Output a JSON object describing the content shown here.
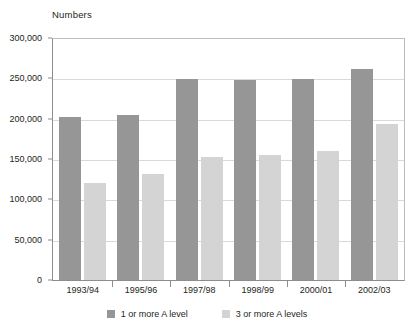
{
  "chart_data": {
    "type": "bar",
    "title": "Numbers",
    "xlabel": "",
    "ylabel": "Numbers",
    "categories": [
      "1993/94",
      "1995/96",
      "1997/98",
      "1998/99",
      "2000/01",
      "2002/03"
    ],
    "series": [
      {
        "name": "1 or more A level",
        "color": "#969696",
        "values": [
          202000,
          205000,
          249000,
          248000,
          249000,
          261000
        ]
      },
      {
        "name": "3 or more A levels",
        "color": "#d4d4d4",
        "values": [
          120000,
          131000,
          153000,
          155000,
          160000,
          193000
        ]
      }
    ],
    "ylim": [
      0,
      300000
    ],
    "ytick_values": [
      0,
      50000,
      100000,
      150000,
      200000,
      250000,
      300000
    ],
    "ytick_labels": [
      "0",
      "50,000",
      "100,000",
      "150,000",
      "200,000",
      "250,000",
      "300,000"
    ],
    "grid": true,
    "legend_position": "bottom"
  },
  "legend": {
    "items": [
      {
        "label": "1 or more A level",
        "color": "#969696",
        "swatch_name": "legend-swatch-1-or-more-a-level"
      },
      {
        "label": "3 or more A levels",
        "color": "#d4d4d4",
        "swatch_name": "legend-swatch-3-or-more-a-levels"
      }
    ]
  },
  "colors": {
    "series_a": "#969696",
    "series_b": "#d4d4d4",
    "axis": "#8d8d8d",
    "gridline": "#d9d9d9",
    "text": "#231f20",
    "background": "#ffffff"
  }
}
